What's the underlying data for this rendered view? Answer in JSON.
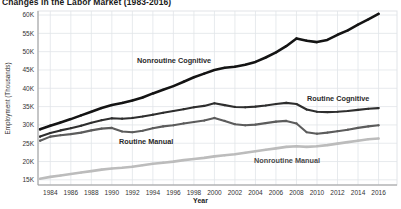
{
  "chart_data": {
    "type": "line",
    "title": "Changes in the Labor Market (1983-2016)",
    "xlabel": "Year",
    "ylabel": "Employment (Thousands)",
    "grid": true,
    "legend": "inline-labels",
    "xlim": [
      1982.8,
      2017.8
    ],
    "ylim": [
      13.6,
      61.1
    ],
    "xticks": [
      1984,
      1986,
      1988,
      1990,
      1992,
      1994,
      1996,
      1998,
      2000,
      2002,
      2004,
      2006,
      2008,
      2010,
      2012,
      2014,
      2016
    ],
    "yticks": [
      15,
      20,
      25,
      30,
      35,
      40,
      45,
      50,
      55,
      60
    ],
    "ytick_suffix": "K",
    "x": [
      1983,
      1984,
      1985,
      1986,
      1987,
      1988,
      1989,
      1990,
      1991,
      1992,
      1993,
      1994,
      1995,
      1996,
      1997,
      1998,
      1999,
      2000,
      2001,
      2002,
      2003,
      2004,
      2005,
      2006,
      2007,
      2008,
      2009,
      2010,
      2011,
      2012,
      2013,
      2014,
      2015,
      2016
    ],
    "series": [
      {
        "name": "Nonroutine Cognitive",
        "color": "#141414",
        "width": 2.6,
        "values": [
          28.8,
          29.8,
          30.7,
          31.6,
          32.6,
          33.6,
          34.6,
          35.4,
          36.0,
          36.7,
          37.5,
          38.6,
          39.6,
          40.6,
          41.8,
          43.0,
          44.0,
          45.0,
          45.6,
          45.9,
          46.4,
          47.2,
          48.4,
          49.8,
          51.5,
          53.6,
          53.0,
          52.6,
          53.2,
          54.6,
          55.8,
          57.4,
          58.8,
          60.3
        ]
      },
      {
        "name": "Routine Cognitive",
        "color": "#2e2e2e",
        "width": 2.1,
        "values": [
          26.8,
          27.8,
          28.5,
          29.1,
          29.8,
          30.6,
          31.3,
          31.8,
          31.7,
          31.9,
          32.3,
          32.8,
          33.3,
          33.8,
          34.3,
          34.8,
          35.2,
          35.9,
          35.4,
          34.9,
          34.8,
          35.0,
          35.3,
          35.7,
          36.0,
          35.7,
          34.2,
          33.6,
          33.5,
          33.6,
          33.8,
          34.1,
          34.4,
          34.6
        ]
      },
      {
        "name": "Routine Manual",
        "color": "#5c5c5c",
        "width": 2.1,
        "values": [
          25.7,
          26.8,
          27.2,
          27.5,
          27.9,
          28.5,
          29.0,
          29.2,
          28.2,
          28.0,
          28.4,
          29.1,
          29.6,
          29.9,
          30.4,
          30.8,
          31.2,
          31.9,
          31.1,
          30.2,
          29.9,
          30.1,
          30.5,
          30.9,
          31.1,
          30.4,
          28.0,
          27.6,
          27.9,
          28.3,
          28.7,
          29.2,
          29.6,
          29.9
        ]
      },
      {
        "name": "Nonroutine Manual",
        "color": "#bcbcbc",
        "width": 2.6,
        "values": [
          15.3,
          15.8,
          16.2,
          16.6,
          17.0,
          17.4,
          17.8,
          18.1,
          18.3,
          18.6,
          19.0,
          19.4,
          19.7,
          20.0,
          20.4,
          20.7,
          21.0,
          21.4,
          21.7,
          22.0,
          22.4,
          22.8,
          23.2,
          23.6,
          24.0,
          24.2,
          24.0,
          24.2,
          24.5,
          24.9,
          25.3,
          25.7,
          26.1,
          26.3
        ]
      }
    ],
    "colors": {
      "grid": "#e1e4e8",
      "axis": "#9a9a9a",
      "tick_text": "#333333",
      "background": "#ffffff"
    }
  }
}
